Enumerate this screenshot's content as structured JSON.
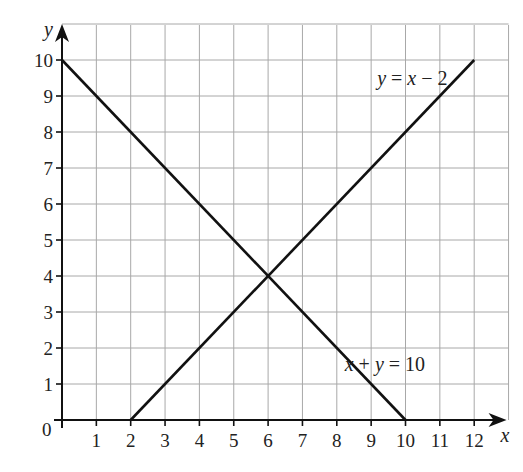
{
  "chart_data": {
    "type": "line",
    "title": "",
    "xlabel": "x",
    "ylabel": "y",
    "origin_label": "0",
    "xlim": [
      0,
      13
    ],
    "ylim": [
      0,
      11
    ],
    "x_ticks": [
      1,
      2,
      3,
      4,
      5,
      6,
      7,
      8,
      9,
      10,
      11,
      12
    ],
    "y_ticks": [
      1,
      2,
      3,
      4,
      5,
      6,
      7,
      8,
      9,
      10
    ],
    "x_tick_labels": [
      "1",
      "2",
      "3",
      "4",
      "5",
      "6",
      "7",
      "8",
      "9",
      "10",
      "11",
      "12"
    ],
    "y_tick_labels": [
      "1",
      "2",
      "3",
      "4",
      "5",
      "6",
      "7",
      "8",
      "9",
      "10"
    ],
    "grid": true,
    "series": [
      {
        "name": "y = x − 2",
        "label": "y = x − 2",
        "x": [
          2,
          12
        ],
        "y": [
          0,
          10
        ],
        "label_at": [
          10.2,
          9.5
        ]
      },
      {
        "name": "x + y = 10",
        "label": "x + y = 10",
        "x": [
          0,
          10
        ],
        "y": [
          10,
          0
        ],
        "label_at": [
          9.4,
          1.55
        ]
      }
    ],
    "intersection": [
      6,
      4
    ]
  }
}
